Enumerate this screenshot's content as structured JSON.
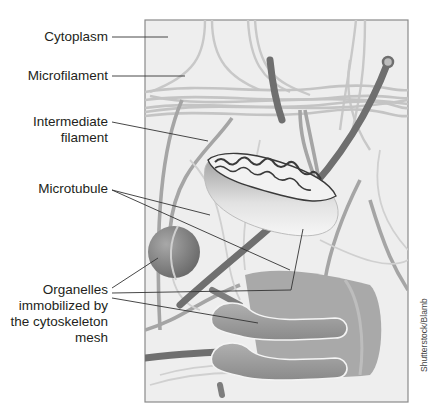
{
  "figure": {
    "labels": {
      "cytoplasm": "Cytoplasm",
      "microfilament": "Microfilament",
      "intermediate_line1": "Intermediate",
      "intermediate_line2": "filament",
      "microtubule": "Microtubule",
      "organelles_line1": "Organelles",
      "organelles_line2": "immobilized by",
      "organelles_line3": "the cytoskeleton",
      "organelles_line4": "mesh"
    },
    "credit": "Shutterstock/Blamb",
    "colors": {
      "background": "#ffffff",
      "cell_fill": "#eeeeee",
      "frame": "#8a8a8a",
      "microfilament": "#c4c4c4",
      "intermediate_filament": "#a3a3a3",
      "microtubule": "#6f6f6f",
      "organelle": "#8e8e8e",
      "leader_line": "#333333"
    }
  }
}
